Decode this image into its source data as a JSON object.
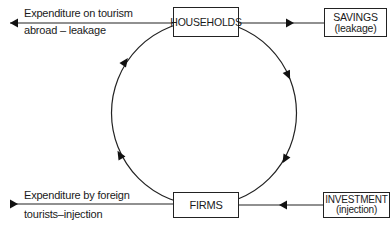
{
  "nodes": {
    "households": {
      "label": "HOUSEHOLDS"
    },
    "firms": {
      "label": "FIRMS"
    },
    "savings": {
      "label": "SAVINGS",
      "sublabel": "(leakage)"
    },
    "investment": {
      "label": "INVESTMENT",
      "sublabel": "(injection)"
    }
  },
  "flows": {
    "tourism_abroad": {
      "line1": "Expenditure on tourism",
      "line2": "abroad – leakage"
    },
    "foreign_tourists": {
      "line1": "Expenditure by foreign",
      "line2": "tourists–injection"
    }
  },
  "colors": {
    "line": "#222222",
    "background": "#ffffff"
  }
}
